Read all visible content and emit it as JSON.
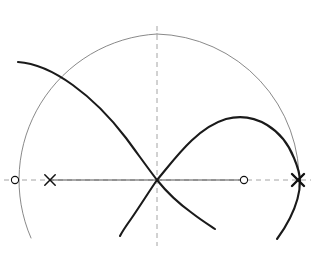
{
  "figure": {
    "title": "Cubic curve with a node, its circumscribed circle, real axis and marked points",
    "canvas": {
      "width": 315,
      "height": 254,
      "background": "#ffffff"
    },
    "colors": {
      "curve": "#1a1a1a",
      "circle": "#6b6b6b",
      "axis": "#555555",
      "dashed": "#9a9a9a",
      "marker": "#111111"
    },
    "strokes": {
      "curve_width": 2.1,
      "circle_width": 0.8,
      "axis_width": 1.1,
      "dashed_width": 0.9,
      "dash_pattern": "5 4"
    },
    "geometry": {
      "center": {
        "x": 157,
        "y": 180
      },
      "circle_radius": 146,
      "vertical_axis_x": 157,
      "horizontal_axis_y": 180,
      "vertical_axis_top_y": 26,
      "vertical_axis_bottom_y": 246,
      "solid_axis_x_start": 50,
      "solid_axis_x_end": 244
    },
    "markers": [
      {
        "name": "left-circle-point",
        "kind": "open-circle",
        "x": 15,
        "y": 180,
        "radius": 3.6,
        "weight": "normal"
      },
      {
        "name": "left-cross-point",
        "kind": "cross",
        "x": 50,
        "y": 180,
        "size": 5.2,
        "weight": "normal"
      },
      {
        "name": "right-circle-point",
        "kind": "open-circle",
        "x": 244,
        "y": 180,
        "radius": 3.6,
        "weight": "normal"
      },
      {
        "name": "right-cross-point",
        "kind": "cross",
        "x": 298,
        "y": 180,
        "size": 6.0,
        "weight": "bold"
      }
    ],
    "paths": {
      "circle": "M 157 34 A 146 146 0 0 1 299 187 M 157 34 A 146 146 0 0 0 31 238",
      "curve_upper_left_branch": "M 18 62 C 52 64 94 96 126 138 C 140 157 150 171 157 180",
      "curve_right_loop": "M 157 180 C 174 160 196 128 226 119 C 256 111 283 130 294 158 C 299 170 300 176 300 181",
      "curve_lower_left_branch": "M 157 180 C 150 190 140 206 131 219 C 126 226 122 232 120 236",
      "curve_lower_right_branch": "M 157 180 C 165 190 178 203 192 213 C 201 220 209 225 215 229",
      "curve_right_lower_tail": "M 300 181 C 300 192 296 206 290 218 C 285 228 280 235 277 239"
    },
    "elements": {
      "circle_label": "circumscribed circle",
      "node_label": "node (double point)",
      "axis_label": "real axis",
      "vertical_label": "axis of symmetry"
    }
  }
}
